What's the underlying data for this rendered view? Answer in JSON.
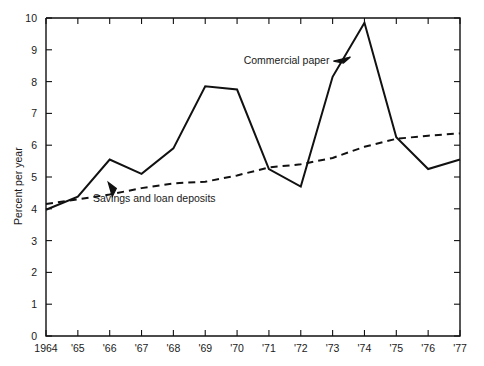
{
  "chart_data": {
    "type": "line",
    "title": "",
    "xlabel": "",
    "ylabel": "Percent per year",
    "xlim": [
      1964,
      1977
    ],
    "ylim": [
      0,
      10
    ],
    "grid": false,
    "legend_position": "inline-annotations",
    "x": [
      1964,
      1965,
      1966,
      1967,
      1968,
      1969,
      1970,
      1971,
      1972,
      1973,
      1974,
      1975,
      1976,
      1977
    ],
    "x_tick_labels": [
      "1964",
      "'65",
      "'66",
      "'67",
      "'68",
      "'69",
      "'70",
      "'71",
      "'72",
      "'73",
      "'74",
      "'75",
      "'76",
      "'77"
    ],
    "y_tick_labels": [
      "0",
      "1",
      "2",
      "3",
      "4",
      "5",
      "6",
      "7",
      "8",
      "9",
      "10"
    ],
    "y_ticks": [
      0,
      1,
      2,
      3,
      4,
      5,
      6,
      7,
      8,
      9,
      10
    ],
    "series": [
      {
        "name": "Commercial paper",
        "style": "solid",
        "values": [
          3.97,
          4.38,
          5.55,
          5.1,
          5.9,
          7.85,
          7.75,
          5.25,
          4.7,
          8.15,
          9.85,
          6.25,
          5.25,
          5.55
        ]
      },
      {
        "name": "Savings and loan deposits",
        "style": "dashed",
        "values": [
          4.15,
          4.3,
          4.45,
          4.65,
          4.8,
          4.85,
          5.05,
          5.3,
          5.4,
          5.6,
          5.95,
          6.2,
          6.3,
          6.37
        ]
      }
    ],
    "annotations": [
      {
        "text": "Commercial paper",
        "series": "Commercial paper",
        "x": 1972.9,
        "y": 8.55
      },
      {
        "text": "Savings and loan deposits",
        "series": "Savings and loan deposits",
        "x": 1967.4,
        "y": 4.2
      }
    ]
  },
  "colors": {
    "line": "#111111",
    "axis": "#111111",
    "background": "#ffffff",
    "text": "#1a1a1a"
  }
}
